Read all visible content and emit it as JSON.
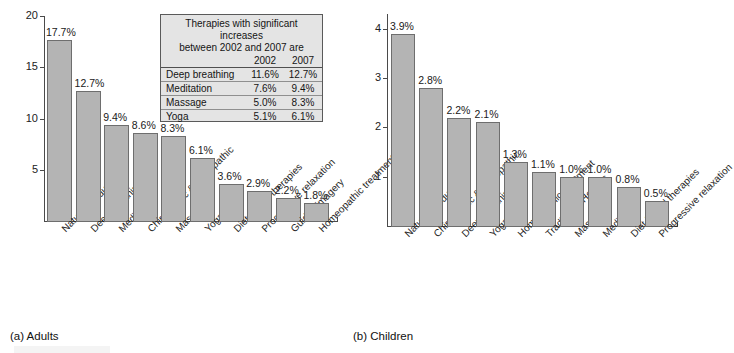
{
  "figure": {
    "background": "#ffffff",
    "bar_fill": "#b4b4b4",
    "bar_stroke": "#6e6e6e",
    "axis_color": "#4a4a4a"
  },
  "panel_a": {
    "caption": "(a) Adults",
    "inset": {
      "title_line1": "Therapies with significant increases",
      "title_line2": "between 2002 and 2007 are",
      "col_blank": "",
      "col_2002": "2002",
      "col_2007": "2007",
      "rows": [
        {
          "therapy": "Deep breathing",
          "v2002": "11.6%",
          "v2007": "12.7%"
        },
        {
          "therapy": "Meditation",
          "v2002": "7.6%",
          "v2007": "9.4%"
        },
        {
          "therapy": "Massage",
          "v2002": "5.0%",
          "v2007": "8.3%"
        },
        {
          "therapy": "Yoga",
          "v2002": "5.1%",
          "v2007": "6.1%"
        }
      ]
    }
  },
  "panel_b": {
    "caption": "(b) Children"
  },
  "chart_data": [
    {
      "type": "bar",
      "title": "(a) Adults",
      "xlabel": "",
      "ylabel": "",
      "ylim": [
        0,
        20
      ],
      "yticks": [
        5,
        10,
        15,
        20
      ],
      "ytick_labels": [
        "5",
        "10",
        "15",
        "20"
      ],
      "grid": false,
      "legend": "none",
      "categories": [
        "Natural products",
        "Deep breathing",
        "Meditation",
        "Chiropractic & osteopathic",
        "Massage",
        "Yoga",
        "Diet-based therapies",
        "Progressive relaxation",
        "Guided imagery",
        "Homeopathic treatment"
      ],
      "values": [
        17.7,
        12.7,
        9.4,
        8.6,
        8.3,
        6.1,
        3.6,
        2.9,
        2.2,
        1.8
      ],
      "data_labels": [
        "17.7%",
        "12.7%",
        "9.4%",
        "8.6%",
        "8.3%",
        "6.1%",
        "3.6%",
        "2.9%",
        "2.2%",
        "1.8%"
      ]
    },
    {
      "type": "bar",
      "title": "(b) Children",
      "xlabel": "",
      "ylabel": "",
      "ylim": [
        0,
        4.3
      ],
      "yticks": [
        1,
        2,
        3,
        4
      ],
      "ytick_labels": [
        "1",
        "2",
        "3",
        "4"
      ],
      "grid": false,
      "legend": "none",
      "categories": [
        "Natural products",
        "Chiropractic & osteopathic",
        "Deep breathing",
        "Yoga",
        "Homeopathic treatment",
        "Traditional Healers",
        "Massage",
        "Meditation",
        "Diet-based therapies",
        "Progressive relaxation"
      ],
      "values": [
        3.9,
        2.8,
        2.2,
        2.1,
        1.3,
        1.1,
        1.0,
        1.0,
        0.8,
        0.5
      ],
      "data_labels": [
        "3.9%",
        "2.8%",
        "2.2%",
        "2.1%",
        "1.3%",
        "1.1%",
        "1.0%",
        "1.0%",
        "0.8%",
        "0.5%"
      ]
    }
  ]
}
